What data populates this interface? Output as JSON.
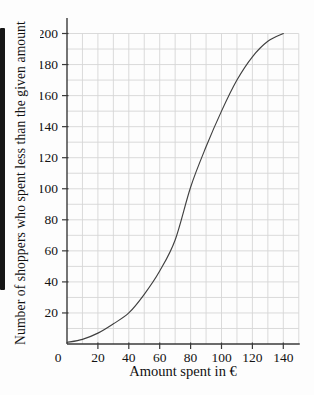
{
  "figure": {
    "background_color": "#fdfdfd",
    "scan_artifact_bar_color": "#161616"
  },
  "chart_data": {
    "type": "line",
    "subtype": "cumulative-frequency-ogive",
    "title": "",
    "xlabel": "Amount spent in €",
    "ylabel": "Number of shoppers who spent less than the given amount",
    "x": [
      0,
      10,
      20,
      30,
      40,
      50,
      60,
      70,
      80,
      90,
      100,
      110,
      120,
      130,
      140
    ],
    "y": [
      1,
      3,
      7,
      13,
      20,
      32,
      47,
      67,
      101,
      127,
      150,
      170,
      185,
      195,
      200
    ],
    "xlim": [
      0,
      150
    ],
    "ylim": [
      0,
      210
    ],
    "x_ticks": [
      0,
      20,
      40,
      60,
      80,
      100,
      120,
      140
    ],
    "y_ticks": [
      20,
      40,
      60,
      80,
      100,
      120,
      140,
      160,
      180,
      200
    ],
    "grid": "on",
    "grid_step_x": 10,
    "grid_step_y": 10,
    "legend": "none",
    "curve_color": "#404040",
    "grid_color": "#d6d6d6",
    "axis_color": "#3a3a3a",
    "tick_label_color": "#131313"
  }
}
